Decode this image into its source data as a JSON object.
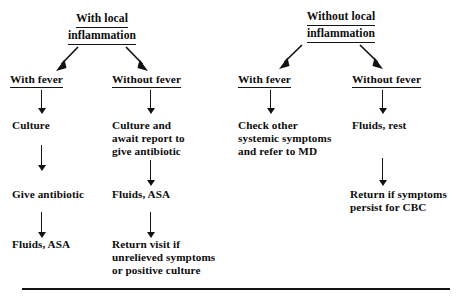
{
  "diagram": {
    "type": "decision-tree",
    "ink_color": "#121212",
    "background_color": "#ffffff",
    "groups": [
      {
        "id": "with-local-inflammation",
        "head_line1": "With local",
        "head_line2": "inflammation",
        "branches": [
          {
            "id": "with-fever-local",
            "label": "With fever",
            "steps": [
              "Culture",
              "Give antibiotic",
              "Fluids, ASA"
            ]
          },
          {
            "id": "without-fever-local",
            "label": "Without fever",
            "steps": [
              "Culture and\nawait report to\ngive antibiotic",
              "Fluids, ASA",
              "Return visit if\nunrelieved symptoms\nor positive culture"
            ]
          }
        ]
      },
      {
        "id": "without-local-inflammation",
        "head_line1": "Without local",
        "head_line2": "inflammation",
        "branches": [
          {
            "id": "with-fever-systemic",
            "label": "With fever",
            "steps": [
              "Check other\nsystemic symptoms\nand refer to MD"
            ]
          },
          {
            "id": "without-fever-systemic",
            "label": "Without fever",
            "steps": [
              "Fluids, rest",
              "Return if symptoms\npersist for CBC"
            ]
          }
        ]
      }
    ]
  }
}
